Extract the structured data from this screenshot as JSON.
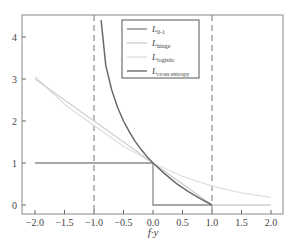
{
  "chart_data": {
    "type": "line",
    "title": "",
    "xlabel": "f·y",
    "ylabel": "",
    "xlim": [
      -2.25,
      2.2
    ],
    "ylim": [
      -0.2,
      4.5
    ],
    "grid": false,
    "legend_position": "upper center",
    "x_ticks": [
      "-2.0",
      "-1.5",
      "-1.0",
      "-0.5",
      "0.0",
      "0.5",
      "1.0",
      "1.5",
      "2.0"
    ],
    "y_ticks": [
      "0",
      "1",
      "2",
      "3",
      "4"
    ],
    "vlines": [
      -1.0,
      1.0
    ],
    "series": [
      {
        "name": "L_{0-1}",
        "label_main": "L",
        "label_sub": "0-1",
        "color": "#8a8a8a",
        "x": [
          -2.0,
          0.0,
          0.0,
          1.0
        ],
        "y": [
          1,
          1,
          0,
          0
        ]
      },
      {
        "name": "L_hinge",
        "label_main": "L",
        "label_sub": "hinge",
        "color": "#cfcfcf",
        "x": [
          -2.0,
          -1.0,
          0.0,
          1.0,
          2.0
        ],
        "y": [
          3,
          2,
          1,
          0,
          0
        ]
      },
      {
        "name": "L_logistic",
        "label_main": "L",
        "label_sub": "logistic",
        "color": "#e0e0e0",
        "x": [
          -2.0,
          -1.5,
          -1.0,
          -0.5,
          0.0,
          0.5,
          1.0,
          1.5,
          2.0
        ],
        "y": [
          3.06,
          2.4,
          1.89,
          1.4,
          1.0,
          0.68,
          0.45,
          0.29,
          0.18
        ]
      },
      {
        "name": "L_cross entropy",
        "label_main": "L",
        "label_sub": "cross entropy",
        "color": "#6a6a6a",
        "x": [
          -0.88,
          -0.8,
          -0.7,
          -0.6,
          -0.5,
          -0.4,
          -0.3,
          -0.2,
          -0.1,
          0.0,
          0.2,
          0.4,
          0.6,
          0.8,
          1.0
        ],
        "y": [
          4.4,
          3.32,
          2.74,
          2.32,
          2.0,
          1.74,
          1.51,
          1.32,
          1.15,
          1.0,
          0.74,
          0.51,
          0.32,
          0.15,
          0.0
        ]
      }
    ]
  }
}
